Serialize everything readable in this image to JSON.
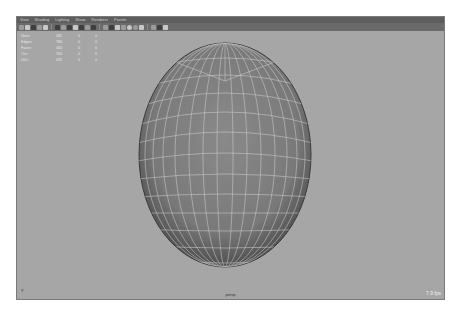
{
  "menu": {
    "items": [
      "View",
      "Shading",
      "Lighting",
      "Show",
      "Renderer",
      "Panels"
    ]
  },
  "toolbar": {
    "icons": [
      "select-camera-icon",
      "camera-attributes-icon",
      "bookmark-icon",
      "image-plane-icon",
      "arrow-icon",
      "grid-icon",
      "film-gate-icon",
      "resolution-gate-icon",
      "gate-mask-icon",
      "field-chart-icon",
      "safe-action-icon",
      "safe-title-icon",
      "wireframe-icon",
      "smooth-shade-icon",
      "default-material-icon",
      "textured-icon",
      "use-lights-icon",
      "shadows-icon",
      "ambient-occlusion-icon",
      "isolate-select-icon",
      "xray-icon",
      "camera-arrow-icon"
    ]
  },
  "hud": {
    "rows": [
      {
        "label": "Verts:",
        "value": "382",
        "selected": "0",
        "extra": "0"
      },
      {
        "label": "Edges:",
        "value": "780",
        "selected": "0",
        "extra": "0"
      },
      {
        "label": "Faces:",
        "value": "400",
        "selected": "0",
        "extra": "0"
      },
      {
        "label": "Tris:",
        "value": "760",
        "selected": "0",
        "extra": "0"
      },
      {
        "label": "UVs:",
        "value": "439",
        "selected": "0",
        "extra": "0"
      }
    ]
  },
  "viewport": {
    "camera": "persp",
    "fps": "7.9 fps",
    "axis_label": "Y"
  },
  "colors": {
    "background": "#a6a6a6",
    "menubar": "#5e5e5e",
    "toolbar": "#6a6a6a",
    "sphere_fill": "#7e7e7e",
    "wireframe": "#d9d9d9"
  }
}
